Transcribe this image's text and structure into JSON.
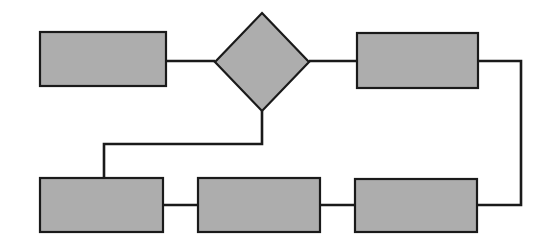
{
  "canvas": {
    "width": 553,
    "height": 250,
    "background_color": "#ffffff"
  },
  "style": {
    "node_fill": "#adadad",
    "node_stroke": "#1a1a1a",
    "node_stroke_width": 2.2,
    "connector_stroke": "#1a1a1a",
    "connector_stroke_width": 2.6
  },
  "diagram": {
    "type": "flowchart",
    "title": "",
    "orientation": "left-to-right with feedback loop",
    "node_count": 6,
    "connector_count": 7,
    "has_text_labels": false
  },
  "nodes": [
    {
      "id": "process-top-left",
      "name": "process-box-1",
      "shape": "rectangle",
      "label": "",
      "x": 40,
      "y": 32,
      "width": 126,
      "height": 54
    },
    {
      "id": "decision-top-center",
      "name": "decision-diamond",
      "shape": "diamond",
      "label": "",
      "cx": 262,
      "cy": 62,
      "rx": 47,
      "ry": 49
    },
    {
      "id": "process-top-right",
      "name": "process-box-2",
      "shape": "rectangle",
      "label": "",
      "x": 357,
      "y": 33,
      "width": 121,
      "height": 55
    },
    {
      "id": "process-bottom-left",
      "name": "process-box-3",
      "shape": "rectangle",
      "label": "",
      "x": 40,
      "y": 178,
      "width": 123,
      "height": 54
    },
    {
      "id": "process-bottom-center",
      "name": "process-box-4",
      "shape": "rectangle",
      "label": "",
      "x": 198,
      "y": 178,
      "width": 122,
      "height": 54
    },
    {
      "id": "process-bottom-right",
      "name": "process-box-5",
      "shape": "rectangle",
      "label": "",
      "x": 355,
      "y": 179,
      "width": 122,
      "height": 53
    }
  ],
  "connectors": [
    {
      "id": "conn-box1-to-decision",
      "name": "connector-box1-decision",
      "label": "",
      "points": "166,61 215,61"
    },
    {
      "id": "conn-decision-to-box2",
      "name": "connector-decision-box2",
      "label": "",
      "points": "309,61 357,61"
    },
    {
      "id": "conn-decision-down-to-box3",
      "name": "connector-decision-box3",
      "label": "",
      "points": "262,111 262,144 104,144 104,178"
    },
    {
      "id": "conn-box3-to-box4",
      "name": "connector-box3-box4",
      "label": "",
      "points": "163,205 198,205"
    },
    {
      "id": "conn-box4-to-box5",
      "name": "connector-box4-box5",
      "label": "",
      "points": "320,205 355,205"
    },
    {
      "id": "conn-box2-feedback-loop",
      "name": "connector-box2-feedback-box5",
      "label": "",
      "points": "478,61 521,61 521,205 477,205"
    }
  ]
}
